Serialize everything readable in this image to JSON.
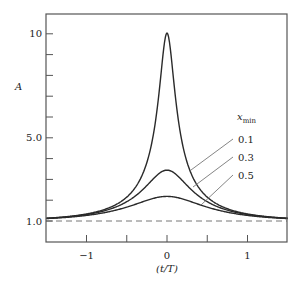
{
  "chart_data": {
    "type": "line",
    "title": "",
    "xlabel": "(t/T)",
    "ylabel": "A",
    "xlim": [
      -1.5,
      1.5
    ],
    "ylim": [
      0.0,
      11.5
    ],
    "x_ticks": [
      -1,
      -0.5,
      0,
      0.5,
      1
    ],
    "x_tick_labels": [
      "−1",
      "",
      "0",
      "",
      "1"
    ],
    "y_ticks": [
      1,
      2,
      3,
      4,
      5,
      6,
      7,
      8,
      9,
      10
    ],
    "y_tick_labels": {
      "1": "1.0",
      "5": "5.0",
      "10": "10"
    },
    "grid": false,
    "legend": {
      "title": "x",
      "title_sub": "min",
      "position": "right-middle, leader lines to curves"
    },
    "reference_line": {
      "y": 1.0,
      "style": "dashed",
      "label": "A = 1"
    },
    "series": [
      {
        "name": "0.1",
        "x_min": 0.1,
        "t": [
          0,
          0.05,
          0.1,
          0.15,
          0.2,
          0.3,
          0.4,
          0.5,
          0.6,
          0.8,
          1.0,
          1.2,
          1.5
        ],
        "A": [
          10.04,
          8.99,
          7.12,
          5.61,
          4.56,
          3.28,
          2.58,
          2.15,
          1.86,
          1.52,
          1.34,
          1.227,
          1.133
        ]
      },
      {
        "name": "0.3",
        "x_min": 0.3,
        "t": [
          0,
          0.1,
          0.2,
          0.3,
          0.4,
          0.5,
          0.6,
          0.8,
          1.0,
          1.2,
          1.5
        ],
        "A": [
          3.36,
          3.22,
          2.91,
          2.51,
          2.18,
          1.93,
          1.73,
          1.47,
          1.31,
          1.213,
          1.127
        ]
      },
      {
        "name": "0.5",
        "x_min": 0.5,
        "t": [
          0,
          0.2,
          0.4,
          0.6,
          0.8,
          1.0,
          1.2,
          1.5
        ],
        "A": [
          2.18,
          2.05,
          1.79,
          1.56,
          1.395,
          1.269,
          1.186,
          1.116
        ]
      }
    ],
    "annotations": [
      {
        "text": "0.1",
        "points_to_series": "0.1"
      },
      {
        "text": "0.3",
        "points_to_series": "0.3"
      },
      {
        "text": "0.5",
        "points_to_series": "0.5"
      }
    ]
  },
  "colors": {
    "curve": "#2a2a2a",
    "axis": "#555555",
    "leader": "#666666",
    "dashed": "#777777"
  }
}
